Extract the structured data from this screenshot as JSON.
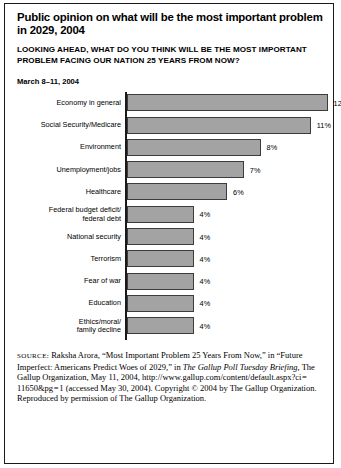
{
  "figure": {
    "title": "Public opinion on what will be the most important problem in 2029, 2004",
    "subtitle": "LOOKING AHEAD, WHAT DO YOU THINK WILL BE THE MOST IMPORTANT PROBLEM FACING OUR NATION 25 YEARS FROM NOW?",
    "date_note": "March 8–11, 2004",
    "frame_color": "#1a1a1a",
    "bar_fill_color": "#a3a3a3",
    "bar_edge_color": "#3c3c3c"
  },
  "source": {
    "label": "SOURCE:",
    "part1": " Raksha Arora, “Most Important Problem 25 Years From Now,” in “Future Imperfect: Americans Predict Woes of 2029,” in ",
    "italic1": "The Gallup Poll Tuesday Briefing,",
    "part2": " The Gallup Organization, May 11, 2004, http://www.gallup.com/content/default.aspx?ci = 11650&pg = 1 (accessed May 30, 2004). Copyright © 2004 by The Gallup Organization. Reproduced by permission of The Gallup Organization."
  },
  "chart_data": {
    "type": "bar",
    "orientation": "horizontal",
    "title": "Public opinion on what will be the most important problem in 2029, 2004",
    "subtitle": "LOOKING AHEAD, WHAT DO YOU THINK WILL BE THE MOST IMPORTANT PROBLEM FACING OUR NATION 25 YEARS FROM NOW?",
    "xlabel": "",
    "ylabel": "",
    "xlim": [
      0,
      13
    ],
    "grid": false,
    "legend": "none",
    "annotation": "March 8–11, 2004",
    "unit": "%",
    "categories": [
      "Economy in general",
      "Social Security/Medicare",
      "Environment",
      "Unemployment/jobs",
      "Healthcare",
      "Federal budget deficit/ federal debt",
      "National security",
      "Terrorism",
      "Fear of war",
      "Education",
      "Ethics/moral/ family decline"
    ],
    "values": [
      12,
      11,
      8,
      7,
      6,
      4,
      4,
      4,
      4,
      4,
      4
    ],
    "value_labels": [
      "12%",
      "11%",
      "8%",
      "7%",
      "6%",
      "4%",
      "4%",
      "4%",
      "4%",
      "4%",
      "4%"
    ],
    "bars": [
      {
        "label_lines": [
          "Economy in general"
        ],
        "value": 12,
        "value_label": "12%"
      },
      {
        "label_lines": [
          "Social Security/Medicare"
        ],
        "value": 11,
        "value_label": "11%"
      },
      {
        "label_lines": [
          "Environment"
        ],
        "value": 8,
        "value_label": "8%"
      },
      {
        "label_lines": [
          "Unemployment/jobs"
        ],
        "value": 7,
        "value_label": "7%"
      },
      {
        "label_lines": [
          "Healthcare"
        ],
        "value": 6,
        "value_label": "6%"
      },
      {
        "label_lines": [
          "Federal budget deficit/",
          "federal debt"
        ],
        "value": 4,
        "value_label": "4%"
      },
      {
        "label_lines": [
          "National security"
        ],
        "value": 4,
        "value_label": "4%"
      },
      {
        "label_lines": [
          "Terrorism"
        ],
        "value": 4,
        "value_label": "4%"
      },
      {
        "label_lines": [
          "Fear of war"
        ],
        "value": 4,
        "value_label": "4%"
      },
      {
        "label_lines": [
          "Education"
        ],
        "value": 4,
        "value_label": "4%"
      },
      {
        "label_lines": [
          "Ethics/moral/",
          "family decline"
        ],
        "value": 4,
        "value_label": "4%"
      }
    ]
  }
}
